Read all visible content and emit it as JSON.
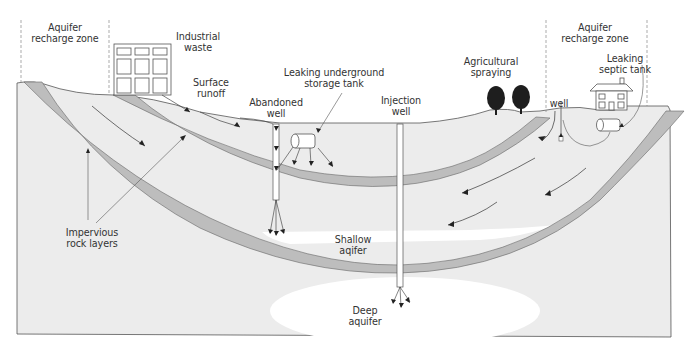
{
  "diagram": {
    "colors": {
      "ground": "#ececec",
      "rock_layer": "#bdbdbd",
      "aquifer": "#ffffff",
      "outline": "#555555",
      "arrow": "#222222",
      "text": "#333333",
      "tree": "#1e1e1e"
    },
    "labels": {
      "recharge_left": "Aquifer\nrecharge zone",
      "industrial_waste": "Industrial\nwaste",
      "surface_runoff": "Surface\nrunoff",
      "leaking_tank": "Leaking underground\nstorage tank",
      "abandoned_well": "Abandoned\nwell",
      "injection_well": "Injection\nwell",
      "agricultural": "Agricultural\nspraying",
      "recharge_right": "Aquifer\nrecharge zone",
      "septic": "Leaking\nseptic tank",
      "well": "well",
      "impervious": "Impervious\nrock layers",
      "shallow": "Shallow\naqifer",
      "deep": "Deep\naquifer"
    },
    "elements": [
      {
        "name": "Aquifer recharge zone (left)",
        "type": "zone"
      },
      {
        "name": "Industrial waste",
        "type": "building"
      },
      {
        "name": "Surface runoff",
        "type": "flow"
      },
      {
        "name": "Leaking underground storage tank",
        "type": "tank"
      },
      {
        "name": "Abandoned well",
        "type": "well"
      },
      {
        "name": "Injection well",
        "type": "well"
      },
      {
        "name": "Agricultural spraying",
        "type": "trees"
      },
      {
        "name": "Aquifer recharge zone (right)",
        "type": "zone"
      },
      {
        "name": "Leaking septic tank",
        "type": "tank"
      },
      {
        "name": "well",
        "type": "well"
      },
      {
        "name": "Impervious rock layers",
        "type": "rock"
      },
      {
        "name": "Shallow aqifer",
        "type": "aquifer"
      },
      {
        "name": "Deep aquifer",
        "type": "aquifer"
      }
    ]
  }
}
